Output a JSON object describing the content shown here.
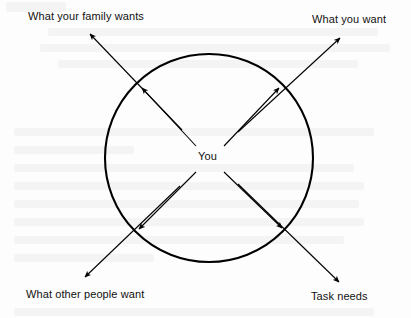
{
  "diagram": {
    "type": "radial-influence-diagram",
    "background_color": "#fdfdfd",
    "stroke_color": "#000000",
    "center": {
      "label": "You",
      "x": 209,
      "y": 158
    },
    "circle": {
      "center_x": 209,
      "center_y": 158,
      "radius": 104,
      "stroke_width": 2
    },
    "nodes": [
      {
        "id": "family",
        "label": "What your family wants",
        "direction": "top-left",
        "tip_x": 89,
        "tip_y": 33
      },
      {
        "id": "you-want",
        "label": "What you want",
        "direction": "top-right",
        "tip_x": 341,
        "tip_y": 37
      },
      {
        "id": "others",
        "label": "What other people want",
        "direction": "bottom-left",
        "tip_x": 84,
        "tip_y": 278
      },
      {
        "id": "task",
        "label": "Task needs",
        "direction": "bottom-right",
        "tip_x": 340,
        "tip_y": 283
      }
    ]
  }
}
